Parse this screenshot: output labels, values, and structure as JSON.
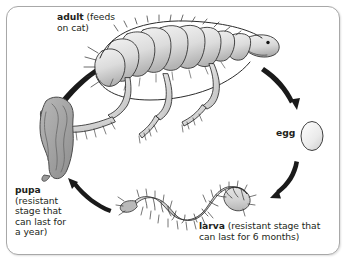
{
  "diagram": {
    "background_color": "#ffffff",
    "border_color": "#a8a8a8",
    "ink_color": "#231f20",
    "body_fill_light": "#e6e6e6",
    "body_fill_mid": "#c9c9c9",
    "body_fill_dark": "#a0a0a0"
  },
  "stages": {
    "adult": {
      "name": "adult",
      "detail": " (feeds\non cat)",
      "icon": "adult-flea-icon"
    },
    "egg": {
      "name": "egg",
      "detail": "",
      "icon": "egg-icon"
    },
    "larva": {
      "name": "larva",
      "detail": " (resistant stage that\ncan last for 6 months)",
      "icon": "larva-icon"
    },
    "pupa": {
      "name": "pupa",
      "detail": "\n(resistant\nstage that\ncan last for\na year)",
      "icon": "pupa-icon"
    }
  },
  "arrows": [
    {
      "name": "arrow-pupa-to-adult",
      "from": "pupa",
      "to": "adult"
    },
    {
      "name": "arrow-adult-to-egg",
      "from": "adult",
      "to": "egg"
    },
    {
      "name": "arrow-egg-to-larva",
      "from": "egg",
      "to": "larva"
    },
    {
      "name": "arrow-larva-to-pupa",
      "from": "larva",
      "to": "pupa"
    }
  ]
}
